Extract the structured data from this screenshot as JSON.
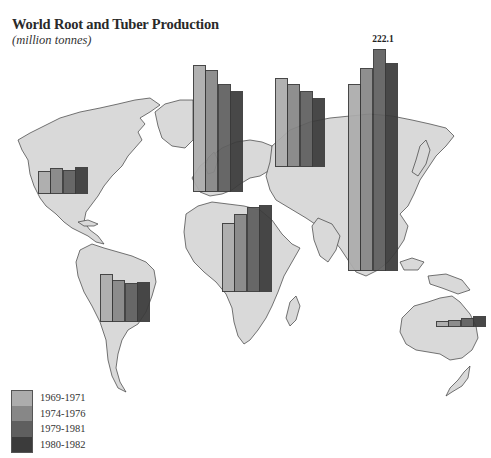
{
  "header": {
    "title": "World Root and Tuber Production",
    "subtitle": "(million tonnes)"
  },
  "legend": {
    "items": [
      {
        "label": "1969-1971",
        "color": "#acacac"
      },
      {
        "label": "1974-1976",
        "color": "#878787"
      },
      {
        "label": "1979-1981",
        "color": "#5f5f5f"
      },
      {
        "label": "1980-1982",
        "color": "#3b3b3b"
      }
    ]
  },
  "annotations": {
    "max_label": "222.1"
  },
  "chart_data": {
    "type": "bar",
    "title": "World Root and Tuber Production",
    "subtitle": "(million tonnes)",
    "xlabel": "",
    "ylabel": "million tonnes",
    "layout": "grouped bars overlaid on world map, one group per region",
    "legend_position": "bottom-left",
    "grid": false,
    "categories": [
      "North America",
      "South America",
      "Western Europe",
      "USSR / Eastern Europe",
      "Africa",
      "Asia",
      "Oceania"
    ],
    "series": [
      {
        "name": "1969-1971",
        "values": [
          23,
          48,
          127,
          89,
          69,
          187,
          6
        ]
      },
      {
        "name": "1974-1976",
        "values": [
          26,
          42,
          122,
          83,
          78,
          203,
          7
        ]
      },
      {
        "name": "1979-1981",
        "values": [
          24,
          39,
          108,
          76,
          85,
          222.1,
          9
        ]
      },
      {
        "name": "1980-1982",
        "values": [
          27,
          40,
          101,
          69,
          87,
          208,
          11
        ]
      }
    ],
    "annotations": [
      {
        "text": "222.1",
        "category": "Asia",
        "series": "1979-1981"
      }
    ],
    "groups": [
      {
        "region": "North America",
        "x": 38,
        "baseline": 194
      },
      {
        "region": "South America",
        "x": 100,
        "baseline": 322
      },
      {
        "region": "Western Europe",
        "x": 193,
        "baseline": 192
      },
      {
        "region": "USSR / Eastern Europe",
        "x": 275,
        "baseline": 167
      },
      {
        "region": "Africa",
        "x": 222,
        "baseline": 292
      },
      {
        "region": "Asia",
        "x": 348,
        "baseline": 271
      },
      {
        "region": "Oceania",
        "x": 436,
        "baseline": 327
      }
    ],
    "bar_width": 12.3,
    "px_per_unit": 1.0
  }
}
